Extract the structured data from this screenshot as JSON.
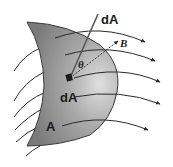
{
  "diagram": {
    "labels": {
      "normal_vector": "dA",
      "field_vector": "B",
      "angle": "θ",
      "area_element": "dA",
      "surface": "A"
    },
    "colors": {
      "surface_fill_dark": "#8a8a8a",
      "surface_fill_light": "#d6d6d6",
      "lines": "#2a2a2a",
      "background": "#ffffff"
    },
    "field_lines_count": 5,
    "incoming_lines_count": 6
  }
}
